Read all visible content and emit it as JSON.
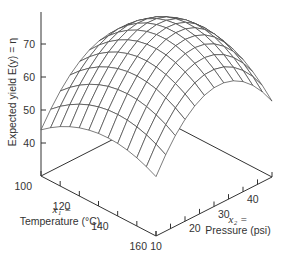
{
  "chart_data": {
    "type": "surface",
    "title": "",
    "zlabel": "Expected yield  E(y) = η",
    "x1label_var": "x₁ =",
    "x1label": "Temperature (°C)",
    "x2label_var": "x₂ =",
    "x2label": "Pressure (psi)",
    "x1_ticks": [
      100,
      120,
      140,
      160
    ],
    "x2_ticks": [
      10,
      20,
      30,
      40
    ],
    "z_ticks": [
      40,
      50,
      60,
      70
    ],
    "x1_range": [
      100,
      160
    ],
    "x2_range": [
      10,
      50
    ],
    "z_range": [
      30,
      75
    ],
    "surface_samples": {
      "x1": [
        100,
        130,
        160
      ],
      "x2": [
        10,
        30,
        50
      ],
      "z": [
        [
          44,
          62,
          55
        ],
        [
          52,
          73,
          64
        ],
        [
          48,
          66,
          53
        ]
      ]
    },
    "grid": false
  }
}
